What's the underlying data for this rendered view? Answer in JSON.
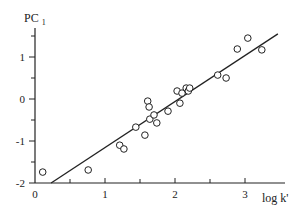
{
  "chart_data": {
    "type": "scatter",
    "title": "",
    "xlabel": "log k'",
    "ylabel": "PC",
    "ylabel_subscript": "1",
    "xlim": [
      0,
      3.5
    ],
    "ylim": [
      -2,
      1.8
    ],
    "x_ticks": [
      0,
      1,
      2,
      3
    ],
    "x_minor_ticks": [
      0.5,
      1.5,
      2.5
    ],
    "y_ticks": [
      -2,
      -1,
      0,
      1
    ],
    "y_minor_ticks": [
      -1.5,
      -0.5,
      0.5,
      1.5
    ],
    "grid": false,
    "legend": null,
    "series": [
      {
        "name": "compounds",
        "marker": "open-circle",
        "points": [
          [
            0.11,
            -1.74
          ],
          [
            0.76,
            -1.69
          ],
          [
            1.21,
            -1.1
          ],
          [
            1.27,
            -1.19
          ],
          [
            1.44,
            -0.67
          ],
          [
            1.57,
            -0.86
          ],
          [
            1.61,
            -0.05
          ],
          [
            1.63,
            -0.19
          ],
          [
            1.64,
            -0.48
          ],
          [
            1.7,
            -0.38
          ],
          [
            1.74,
            -0.57
          ],
          [
            1.9,
            -0.29
          ],
          [
            2.03,
            0.19
          ],
          [
            2.07,
            -0.1
          ],
          [
            2.1,
            0.14
          ],
          [
            2.16,
            0.26
          ],
          [
            2.19,
            0.19
          ],
          [
            2.21,
            0.26
          ],
          [
            2.61,
            0.57
          ],
          [
            2.73,
            0.5
          ],
          [
            2.89,
            1.19
          ],
          [
            3.04,
            1.45
          ],
          [
            3.24,
            1.17
          ]
        ]
      }
    ],
    "regression_line": {
      "x": [
        0.23,
        3.47
      ],
      "y": [
        -2.0,
        1.55
      ]
    }
  },
  "axis": {
    "x_tick_labels": [
      "0",
      "1",
      "2",
      "3"
    ],
    "y_tick_labels": [
      "1",
      "0",
      "-1",
      "-2"
    ],
    "x_title": "log k'",
    "y_title": "PC",
    "y_title_sub": "1"
  }
}
